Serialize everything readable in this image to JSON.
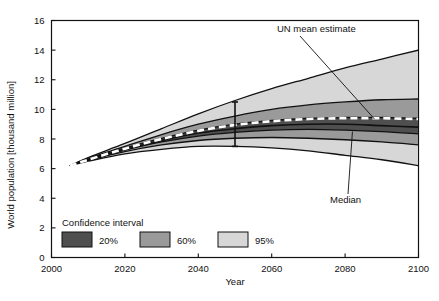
{
  "chart_data": {
    "type": "area",
    "title": "",
    "xlabel": "Year",
    "ylabel": "World population [thousand million]",
    "xlim": [
      2000,
      2100
    ],
    "ylim": [
      0,
      16
    ],
    "xticks": [
      2000,
      2020,
      2040,
      2060,
      2080,
      2100
    ],
    "yticks": [
      0,
      2,
      4,
      6,
      8,
      10,
      12,
      14,
      16
    ],
    "grid": false,
    "legend": {
      "title": "Confidence interval",
      "position": "inside-lower-left",
      "entries": [
        {
          "label": "20%",
          "color": "#4f4f4f"
        },
        {
          "label": "60%",
          "color": "#9a9a9a"
        },
        {
          "label": "95%",
          "color": "#d7d7d7"
        }
      ]
    },
    "x": [
      2005,
      2010,
      2020,
      2030,
      2040,
      2050,
      2060,
      2070,
      2080,
      2090,
      2100
    ],
    "series": [
      {
        "name": "Median",
        "style": "solid-black-line",
        "values": [
          6.2,
          6.6,
          7.3,
          7.9,
          8.4,
          8.7,
          8.9,
          9.0,
          9.0,
          8.9,
          8.8
        ]
      },
      {
        "name": "UN mean estimate",
        "style": "white-dashed-line",
        "values": [
          6.2,
          6.6,
          7.35,
          8.0,
          8.55,
          8.95,
          9.2,
          9.35,
          9.4,
          9.4,
          9.35
        ]
      },
      {
        "name": "95% upper",
        "style": "band-edge",
        "values": [
          6.2,
          6.75,
          7.7,
          8.7,
          9.7,
          10.6,
          11.4,
          12.1,
          12.8,
          13.4,
          14.0
        ]
      },
      {
        "name": "95% lower",
        "style": "band-edge",
        "values": [
          6.2,
          6.5,
          7.0,
          7.3,
          7.5,
          7.5,
          7.4,
          7.2,
          6.9,
          6.6,
          6.2
        ]
      },
      {
        "name": "60% upper",
        "style": "band-edge",
        "values": [
          6.2,
          6.7,
          7.5,
          8.3,
          9.0,
          9.55,
          10.0,
          10.3,
          10.5,
          10.65,
          10.7
        ]
      },
      {
        "name": "60% lower",
        "style": "band-edge",
        "values": [
          6.2,
          6.55,
          7.15,
          7.6,
          7.9,
          8.05,
          8.1,
          8.05,
          7.95,
          7.8,
          7.6
        ]
      },
      {
        "name": "20% upper",
        "style": "band-edge",
        "values": [
          6.2,
          6.65,
          7.4,
          8.05,
          8.6,
          9.0,
          9.25,
          9.4,
          9.45,
          9.45,
          9.4
        ]
      },
      {
        "name": "20% lower",
        "style": "band-edge",
        "values": [
          6.2,
          6.6,
          7.25,
          7.8,
          8.2,
          8.45,
          8.6,
          8.65,
          8.6,
          8.5,
          8.35
        ]
      }
    ],
    "annotations": [
      {
        "name": "un-mean-estimate",
        "text": "UN mean estimate",
        "target_x": 2088,
        "target_y": 9.35
      },
      {
        "name": "median",
        "text": "Median",
        "target_x": 2082,
        "target_y": 8.5
      }
    ],
    "errorbar": {
      "x": 2050,
      "low": 7.5,
      "high": 10.5
    }
  }
}
